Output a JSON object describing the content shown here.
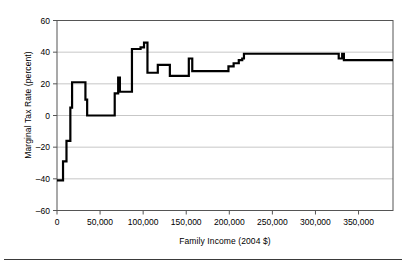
{
  "chart_data": {
    "type": "line",
    "title": "",
    "subtitle": "",
    "xlabel": "Family Income (2004 $)",
    "ylabel": "Marginal Tax Rate (percent)",
    "xlim": [
      0,
      390000
    ],
    "ylim": [
      -60,
      60
    ],
    "xticks": [
      0,
      50000,
      100000,
      150000,
      200000,
      250000,
      300000,
      350000
    ],
    "xtick_labels": [
      "0",
      "50,000",
      "100,000",
      "150,000",
      "200,000",
      "250,000",
      "300,000",
      "350,000"
    ],
    "yticks": [
      -60,
      -40,
      -20,
      0,
      20,
      40,
      60
    ],
    "ytick_labels": [
      "-60",
      "-40",
      "-20",
      "0",
      "20",
      "40",
      "60"
    ],
    "grid": "horizontal",
    "legend": "none",
    "line_color": "#000000",
    "line_width": 2.2,
    "step_shape": "hv",
    "series": [
      {
        "name": "Marginal Tax Rate",
        "x": [
          0,
          5000,
          7000,
          9500,
          11000,
          13000,
          15500,
          17500,
          31000,
          33000,
          35000,
          59000,
          61000,
          67000,
          69000,
          71000,
          73000,
          85000,
          87000,
          95000,
          97000,
          101000,
          103000,
          105000,
          109000,
          117000,
          119000,
          129000,
          131000,
          145000,
          147000,
          150000,
          153000,
          155000,
          157000,
          185000,
          187000,
          197000,
          199000,
          203000,
          205000,
          209000,
          211000,
          213000,
          215000,
          217000,
          327000,
          329000,
          331000,
          333000,
          390000
        ],
        "y": [
          -41,
          -41,
          -29,
          -29,
          -16,
          -16,
          5,
          21,
          21,
          10,
          0,
          0,
          0,
          14,
          14,
          24,
          15,
          15,
          42,
          42,
          43,
          46,
          46,
          27,
          27,
          32,
          32,
          32,
          25,
          25,
          25,
          25,
          36,
          36,
          28,
          28,
          28,
          28,
          31,
          31,
          33,
          33,
          35,
          35,
          36,
          39,
          36,
          36,
          39,
          35,
          35
        ]
      }
    ],
    "annotations": []
  },
  "figure": {
    "x_axis_title": "Family Income (2004 $)",
    "y_axis_title": "Marginal Tax Rate (percent)"
  }
}
